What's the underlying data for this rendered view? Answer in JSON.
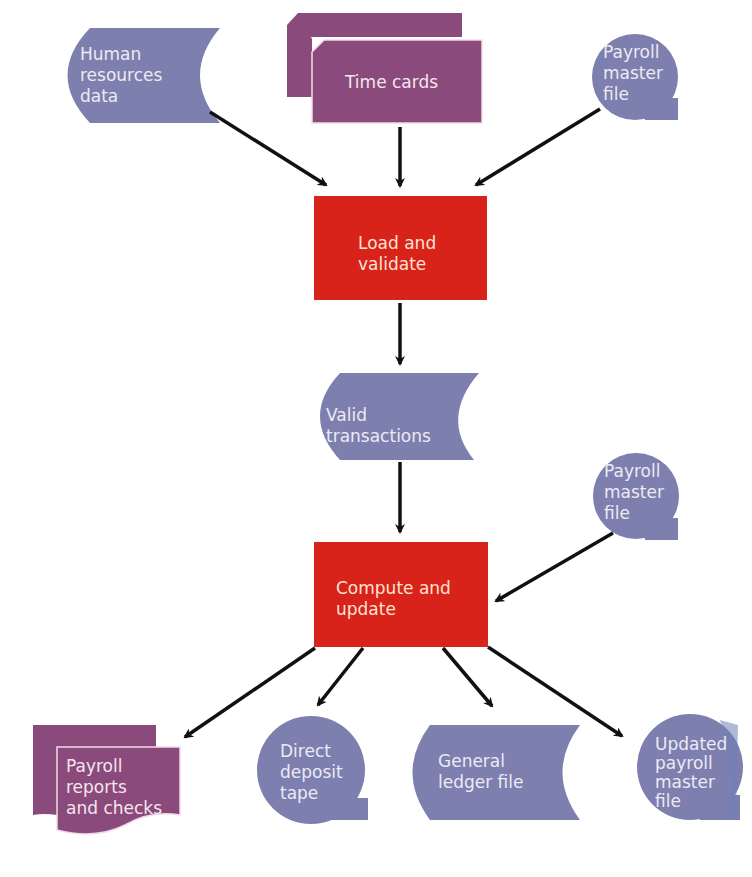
{
  "colors": {
    "data_store": "#7d7fae",
    "document": "#8a4a7c",
    "process": "#d8231a",
    "arrow": "#111111",
    "background": "#ffffff"
  },
  "nodes": {
    "hr_data": {
      "shape": "stored-data",
      "lines": [
        "Human",
        "resources",
        "data"
      ]
    },
    "time_cards": {
      "shape": "multi-card",
      "lines": [
        "Time cards"
      ]
    },
    "payroll_master_top": {
      "shape": "magnetic-tape",
      "lines": [
        "Payroll",
        "master",
        "file"
      ]
    },
    "load_validate": {
      "shape": "process",
      "lines": [
        "Load and",
        "validate"
      ]
    },
    "valid_transactions": {
      "shape": "stored-data",
      "lines": [
        "Valid",
        "transactions"
      ]
    },
    "payroll_master_mid": {
      "shape": "magnetic-tape",
      "lines": [
        "Payroll",
        "master",
        "file"
      ]
    },
    "compute_update": {
      "shape": "process",
      "lines": [
        "Compute and",
        "update"
      ]
    },
    "payroll_reports": {
      "shape": "multi-document",
      "lines": [
        "Payroll",
        "reports",
        "and checks"
      ]
    },
    "direct_deposit": {
      "shape": "magnetic-tape",
      "lines": [
        "Direct",
        "deposit",
        "tape"
      ]
    },
    "general_ledger": {
      "shape": "stored-data",
      "lines": [
        "General",
        "ledger file"
      ]
    },
    "updated_master": {
      "shape": "magnetic-tape",
      "lines": [
        "Updated",
        "payroll",
        "master",
        "file"
      ]
    }
  },
  "edges": [
    {
      "from": "hr_data",
      "to": "load_validate"
    },
    {
      "from": "time_cards",
      "to": "load_validate"
    },
    {
      "from": "payroll_master_top",
      "to": "load_validate"
    },
    {
      "from": "load_validate",
      "to": "valid_transactions"
    },
    {
      "from": "valid_transactions",
      "to": "compute_update"
    },
    {
      "from": "payroll_master_mid",
      "to": "compute_update"
    },
    {
      "from": "compute_update",
      "to": "payroll_reports"
    },
    {
      "from": "compute_update",
      "to": "direct_deposit"
    },
    {
      "from": "compute_update",
      "to": "general_ledger"
    },
    {
      "from": "compute_update",
      "to": "updated_master"
    }
  ]
}
